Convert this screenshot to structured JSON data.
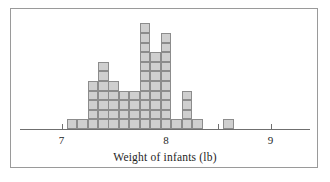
{
  "figure": {
    "caption": "Weight of infants (lb)",
    "border_color": "#9a9a9a",
    "background": "#ffffff"
  },
  "axis": {
    "label": "Weight of infants (lb)",
    "tick_labels": [
      "7",
      "8",
      "9"
    ],
    "tick_values": [
      7,
      8,
      9
    ],
    "line_color": "#6f6f6f",
    "minor_tick_values": [
      7,
      7.5,
      8,
      8.5,
      9
    ]
  },
  "style": {
    "cell_fill": "#cfcfcf",
    "cell_stroke": "#8c8c8c",
    "text_color": "#1e1e1e"
  },
  "chart_data": {
    "type": "bar",
    "title": "",
    "subtitle": "",
    "xlabel": "Weight of infants (lb)",
    "ylabel": "",
    "xlim": [
      6.65,
      9.35
    ],
    "ylim": [
      0,
      11
    ],
    "grid": false,
    "legend": null,
    "note": "Stacked unit-square dotplot: each square represents one infant. Bin width 0.1 lb.",
    "bin_width": 0.1,
    "categories": [
      "7.1",
      "7.2",
      "7.3",
      "7.4",
      "7.5",
      "7.6",
      "7.7",
      "7.8",
      "7.9",
      "8.0",
      "8.1",
      "8.2",
      "8.3",
      "8.5",
      "8.6"
    ],
    "x": [
      7.1,
      7.2,
      7.3,
      7.4,
      7.5,
      7.6,
      7.7,
      7.8,
      7.9,
      8.0,
      8.1,
      8.2,
      8.3,
      8.5,
      8.6
    ],
    "values": [
      1,
      1,
      5,
      7,
      5,
      4,
      4,
      11,
      8,
      10,
      1,
      4,
      1,
      0,
      1
    ],
    "total_count": 63,
    "tick_labels": [
      "7",
      "8",
      "9"
    ],
    "tick_values": [
      7,
      8,
      9
    ]
  }
}
